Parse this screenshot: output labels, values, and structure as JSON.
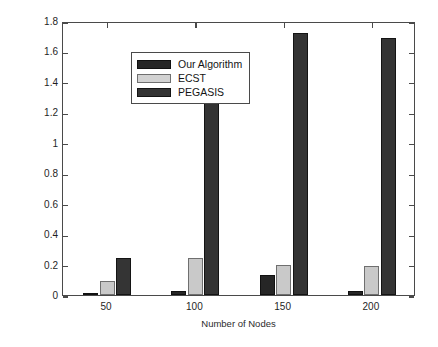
{
  "chart_data": {
    "type": "bar",
    "title": "",
    "xlabel": "Number of Nodes",
    "ylabel": "Average Energy Consumption",
    "categories": [
      "50",
      "100",
      "150",
      "200"
    ],
    "series": [
      {
        "name": "Our Algorithm",
        "color": "#262626",
        "values": [
          0.01,
          0.025,
          0.13,
          0.025
        ]
      },
      {
        "name": "ECST",
        "color": "#d2d2d2",
        "values": [
          0.09,
          0.24,
          0.2,
          0.19
        ]
      },
      {
        "name": "PEGASIS",
        "color": "#343434",
        "values": [
          0.245,
          1.43,
          1.72,
          1.69
        ]
      }
    ],
    "ylim": [
      0,
      1.8
    ],
    "ytick_labels": [
      "0",
      "0.2",
      "0.4",
      "0.6",
      "0.8",
      "1",
      "1.2",
      "1.4",
      "1.6",
      "1.8"
    ],
    "ytick_values": [
      0,
      0.2,
      0.4,
      0.6,
      0.8,
      1.0,
      1.2,
      1.4,
      1.6,
      1.8
    ],
    "xtick_labels": [
      "50",
      "100",
      "150",
      "200"
    ],
    "grid": false,
    "legend_position": "upper left"
  },
  "legend": {
    "entries": [
      {
        "label": "Our Algorithm"
      },
      {
        "label": "ECST"
      },
      {
        "label": "PEGASIS"
      }
    ]
  },
  "axes": {
    "x_title": "Number of Nodes",
    "y_title": "Average Energy Consumption"
  }
}
